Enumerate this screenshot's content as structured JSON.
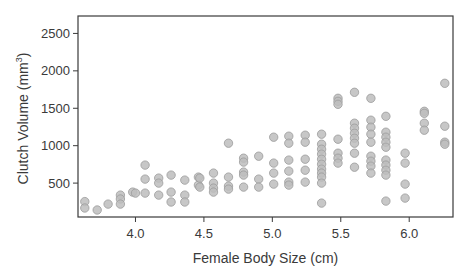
{
  "chart_data": {
    "type": "scatter",
    "title": "",
    "xlabel": "Female Body Size (cm)",
    "ylabel_main": "Clutch Volume (mm",
    "ylabel_sup": "3",
    "ylabel_close": ")",
    "xlim": [
      3.58,
      6.32
    ],
    "ylim": [
      47,
      2733
    ],
    "x_ticks": [
      4.0,
      4.5,
      5.0,
      5.5,
      6.0
    ],
    "x_tick_labels": [
      "4.0",
      "4.5",
      "5.0",
      "5.5",
      "6.0"
    ],
    "y_ticks": [
      500,
      1000,
      1500,
      2000,
      2500
    ],
    "y_tick_labels": [
      "500",
      "1000",
      "1500",
      "2000",
      "2500"
    ],
    "grid": false,
    "legend": null,
    "marker_color": "#bdbdbd",
    "marker_edge": "#9a9a9a",
    "points": [
      [
        3.63,
        253
      ],
      [
        3.63,
        167
      ],
      [
        3.72,
        140
      ],
      [
        3.8,
        220
      ],
      [
        3.89,
        340
      ],
      [
        3.89,
        287
      ],
      [
        3.89,
        220
      ],
      [
        3.98,
        380
      ],
      [
        4.0,
        367
      ],
      [
        4.07,
        740
      ],
      [
        4.07,
        553
      ],
      [
        4.07,
        367
      ],
      [
        4.17,
        567
      ],
      [
        4.17,
        500
      ],
      [
        4.17,
        340
      ],
      [
        4.26,
        607
      ],
      [
        4.26,
        380
      ],
      [
        4.26,
        247
      ],
      [
        4.36,
        540
      ],
      [
        4.36,
        340
      ],
      [
        4.36,
        247
      ],
      [
        4.46,
        580
      ],
      [
        4.46,
        473
      ],
      [
        4.47,
        567
      ],
      [
        4.47,
        447
      ],
      [
        4.57,
        633
      ],
      [
        4.57,
        500
      ],
      [
        4.57,
        433
      ],
      [
        4.57,
        380
      ],
      [
        4.68,
        1033
      ],
      [
        4.68,
        580
      ],
      [
        4.68,
        460
      ],
      [
        4.68,
        420
      ],
      [
        4.79,
        833
      ],
      [
        4.79,
        780
      ],
      [
        4.79,
        647
      ],
      [
        4.79,
        607
      ],
      [
        4.79,
        447
      ],
      [
        4.9,
        860
      ],
      [
        4.9,
        553
      ],
      [
        4.9,
        447
      ],
      [
        5.01,
        1113
      ],
      [
        5.01,
        767
      ],
      [
        5.01,
        633
      ],
      [
        5.01,
        487
      ],
      [
        5.12,
        1127
      ],
      [
        5.12,
        1033
      ],
      [
        5.12,
        807
      ],
      [
        5.12,
        660
      ],
      [
        5.12,
        513
      ],
      [
        5.12,
        473
      ],
      [
        5.24,
        1140
      ],
      [
        5.24,
        1047
      ],
      [
        5.24,
        820
      ],
      [
        5.24,
        673
      ],
      [
        5.24,
        513
      ],
      [
        5.36,
        1153
      ],
      [
        5.36,
        1020
      ],
      [
        5.36,
        953
      ],
      [
        5.36,
        887
      ],
      [
        5.36,
        820
      ],
      [
        5.36,
        753
      ],
      [
        5.36,
        687
      ],
      [
        5.36,
        633
      ],
      [
        5.36,
        580
      ],
      [
        5.36,
        500
      ],
      [
        5.36,
        233
      ],
      [
        5.48,
        1633
      ],
      [
        5.48,
        1593
      ],
      [
        5.48,
        1553
      ],
      [
        5.48,
        1087
      ],
      [
        5.48,
        900
      ],
      [
        5.48,
        833
      ],
      [
        5.48,
        767
      ],
      [
        5.6,
        1713
      ],
      [
        5.6,
        1300
      ],
      [
        5.6,
        1233
      ],
      [
        5.6,
        1167
      ],
      [
        5.6,
        1100
      ],
      [
        5.6,
        1033
      ],
      [
        5.6,
        900
      ],
      [
        5.6,
        713
      ],
      [
        5.72,
        1633
      ],
      [
        5.72,
        1340
      ],
      [
        5.72,
        1247
      ],
      [
        5.72,
        1153
      ],
      [
        5.72,
        1047
      ],
      [
        5.72,
        860
      ],
      [
        5.72,
        793
      ],
      [
        5.72,
        727
      ],
      [
        5.72,
        633
      ],
      [
        5.83,
        1393
      ],
      [
        5.83,
        1180
      ],
      [
        5.83,
        1113
      ],
      [
        5.83,
        1047
      ],
      [
        5.83,
        980
      ],
      [
        5.83,
        807
      ],
      [
        5.83,
        740
      ],
      [
        5.83,
        673
      ],
      [
        5.83,
        607
      ],
      [
        5.83,
        260
      ],
      [
        5.97,
        900
      ],
      [
        5.97,
        767
      ],
      [
        5.97,
        487
      ],
      [
        5.97,
        300
      ],
      [
        6.11,
        1460
      ],
      [
        6.11,
        1433
      ],
      [
        6.11,
        1300
      ],
      [
        6.11,
        1207
      ],
      [
        6.26,
        1833
      ],
      [
        6.26,
        1260
      ],
      [
        6.26,
        1047
      ],
      [
        6.26,
        1020
      ]
    ]
  },
  "layout": {
    "plot_left": 78,
    "plot_right": 453,
    "plot_top": 16,
    "plot_bottom": 217
  }
}
